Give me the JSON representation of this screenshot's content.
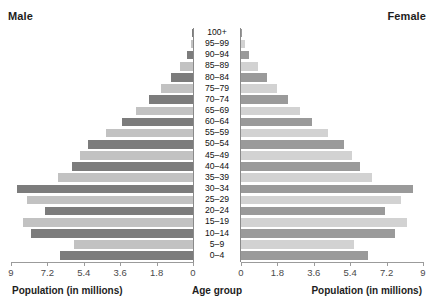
{
  "headings": {
    "left": "Male",
    "right": "Female"
  },
  "axis_titles": {
    "left": "Population (in millions)",
    "center": "Age group",
    "right": "Population (in millions)"
  },
  "tick_labels_left": [
    "9",
    "7.2",
    "5.4",
    "3.6",
    "1.8",
    "0"
  ],
  "tick_labels_right": [
    "0",
    "1.8",
    "3.6",
    "5.4",
    "7.2",
    "9"
  ],
  "colors": {
    "bar_dark_male": "#7c7c7c",
    "bar_light_male": "#c2c2c2",
    "bar_dark_female": "#9a9a9a",
    "bar_light_female": "#d2d2d2",
    "axis": "#9b9b9b",
    "center_rule": "#8a8a8a",
    "text": "#1d1d1d"
  },
  "chart_data": {
    "type": "bar",
    "title": "",
    "subtitle": "",
    "orientation": "horizontal-diverging",
    "chart_kind": "population-pyramid",
    "xlabel": "Population (in millions)",
    "ylabel": "Age group",
    "xlim": [
      0,
      9
    ],
    "xticks": [
      0,
      1.8,
      3.6,
      5.4,
      7.2,
      9
    ],
    "grid": false,
    "legend_position": "top-outside",
    "categories": [
      "0–4",
      "5–9",
      "10–14",
      "15–19",
      "20–24",
      "25–29",
      "30–34",
      "35–39",
      "40–44",
      "45–49",
      "50–54",
      "55–59",
      "60–64",
      "65–69",
      "70–74",
      "75–79",
      "80–84",
      "85–89",
      "90–94",
      "95–99",
      "100+"
    ],
    "series": [
      {
        "name": "Male",
        "side": "left",
        "values": [
          6.6,
          5.9,
          8.0,
          8.4,
          7.3,
          8.2,
          8.7,
          6.7,
          6.0,
          5.6,
          5.2,
          4.3,
          3.5,
          2.8,
          2.2,
          1.6,
          1.1,
          0.65,
          0.3,
          0.12,
          0.05
        ]
      },
      {
        "name": "Female",
        "side": "right",
        "values": [
          6.3,
          5.6,
          7.6,
          8.2,
          7.1,
          7.9,
          8.5,
          6.5,
          5.9,
          5.5,
          5.1,
          4.3,
          3.5,
          2.9,
          2.3,
          1.8,
          1.3,
          0.85,
          0.42,
          0.18,
          0.06
        ]
      }
    ]
  }
}
